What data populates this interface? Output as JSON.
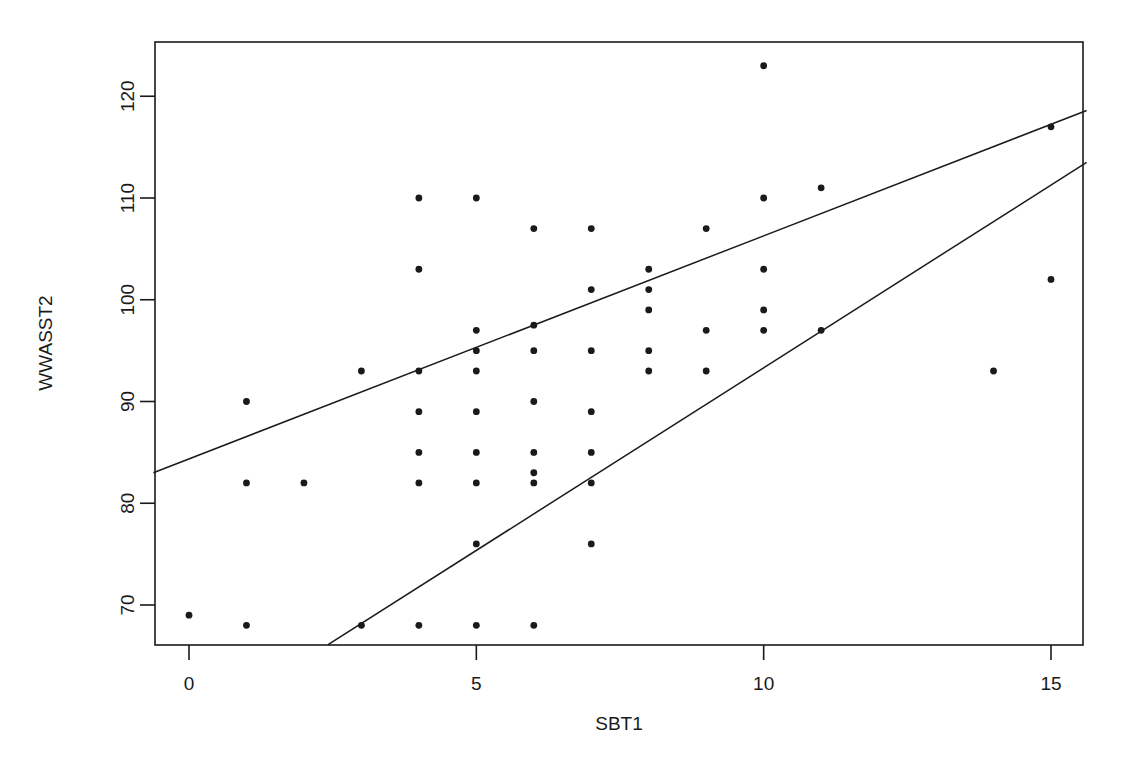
{
  "chart_data": {
    "type": "scatter",
    "title": "",
    "xlabel": "SBT1",
    "ylabel": "WWASST2",
    "xlim": [
      -0.62,
      15.62
    ],
    "ylim": [
      66.1,
      124.3
    ],
    "grid": false,
    "legend": null,
    "xticks": [
      0,
      5,
      10,
      15
    ],
    "xticklabels": [
      "0",
      "5",
      "10",
      "15"
    ],
    "yticks": [
      70,
      80,
      90,
      100,
      110,
      120
    ],
    "yticklabels": [
      "70",
      "80",
      "90",
      "100",
      "110",
      "120"
    ],
    "point_color": "#1a1a1a",
    "line_color": "#1a1a1a",
    "points": [
      {
        "x": 0,
        "y": 69
      },
      {
        "x": 1,
        "y": 90
      },
      {
        "x": 1,
        "y": 82
      },
      {
        "x": 1,
        "y": 68
      },
      {
        "x": 2,
        "y": 82
      },
      {
        "x": 3,
        "y": 93
      },
      {
        "x": 3,
        "y": 68
      },
      {
        "x": 4,
        "y": 110
      },
      {
        "x": 4,
        "y": 103
      },
      {
        "x": 4,
        "y": 93
      },
      {
        "x": 4,
        "y": 89
      },
      {
        "x": 4,
        "y": 85
      },
      {
        "x": 4,
        "y": 82
      },
      {
        "x": 4,
        "y": 68
      },
      {
        "x": 5,
        "y": 110
      },
      {
        "x": 5,
        "y": 97
      },
      {
        "x": 5,
        "y": 95
      },
      {
        "x": 5,
        "y": 93
      },
      {
        "x": 5,
        "y": 89
      },
      {
        "x": 5,
        "y": 85
      },
      {
        "x": 5,
        "y": 82
      },
      {
        "x": 5,
        "y": 76
      },
      {
        "x": 5,
        "y": 68
      },
      {
        "x": 6,
        "y": 107
      },
      {
        "x": 6,
        "y": 97.5
      },
      {
        "x": 6,
        "y": 95
      },
      {
        "x": 6,
        "y": 90
      },
      {
        "x": 6,
        "y": 85
      },
      {
        "x": 6,
        "y": 83
      },
      {
        "x": 6,
        "y": 82
      },
      {
        "x": 6,
        "y": 68
      },
      {
        "x": 7,
        "y": 107
      },
      {
        "x": 7,
        "y": 101
      },
      {
        "x": 7,
        "y": 95
      },
      {
        "x": 7,
        "y": 89
      },
      {
        "x": 7,
        "y": 85
      },
      {
        "x": 7,
        "y": 82
      },
      {
        "x": 7,
        "y": 76
      },
      {
        "x": 8,
        "y": 103
      },
      {
        "x": 8,
        "y": 101
      },
      {
        "x": 8,
        "y": 99
      },
      {
        "x": 8,
        "y": 95
      },
      {
        "x": 8,
        "y": 93
      },
      {
        "x": 9,
        "y": 107
      },
      {
        "x": 9,
        "y": 97
      },
      {
        "x": 9,
        "y": 93
      },
      {
        "x": 10,
        "y": 123
      },
      {
        "x": 10,
        "y": 110
      },
      {
        "x": 10,
        "y": 103
      },
      {
        "x": 10,
        "y": 99
      },
      {
        "x": 10,
        "y": 97
      },
      {
        "x": 11,
        "y": 111
      },
      {
        "x": 11,
        "y": 97
      },
      {
        "x": 14,
        "y": 93
      },
      {
        "x": 15,
        "y": 117
      },
      {
        "x": 15,
        "y": 102
      }
    ],
    "lines": [
      {
        "name": "upper-regression-line",
        "x0": -0.62,
        "y0": 83.0,
        "x1": 15.62,
        "y1": 118.6
      },
      {
        "name": "lower-regression-line",
        "x0": 2.42,
        "y0": 66.1,
        "x1": 15.62,
        "y1": 113.5
      }
    ]
  }
}
